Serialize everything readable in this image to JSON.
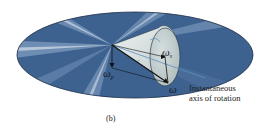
{
  "figure": {
    "panel_label": "(b)",
    "annotation": {
      "line1": "Instantaneous",
      "line2": "axis of rotation"
    },
    "vectors": {
      "omega": {
        "symbol": "ω",
        "subscript": ""
      },
      "omega_s": {
        "symbol": "ω",
        "subscript": "s"
      },
      "omega_p": {
        "symbol": "ω",
        "subscript": "p"
      }
    },
    "colors": {
      "disk_dark": "#3a5f8e",
      "disk_light": "#c9d6e6",
      "cone_fill": "#cdd6d6",
      "cone_base": "#b9c5c4",
      "axis_line": "#5a8fc0",
      "vector": "#111111"
    }
  }
}
